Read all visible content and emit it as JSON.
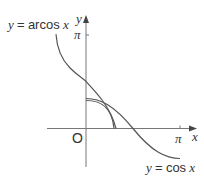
{
  "diagram": {
    "type": "function-graph",
    "axes": {
      "x_label": "x",
      "y_label": "y",
      "origin_label": "O",
      "x_tick_label": "π",
      "y_tick_label": "π"
    },
    "curves": [
      {
        "name": "arccos",
        "label_var": "y",
        "label_eq": "=",
        "label_fn": "arcos",
        "label_arg": "x",
        "color": "#555555"
      },
      {
        "name": "cos",
        "label_var": "y",
        "label_eq": "=",
        "label_fn": "cos",
        "label_arg": "x",
        "color": "#555555"
      },
      {
        "name": "quarter-arc",
        "color": "#555555"
      }
    ],
    "colors": {
      "axis": "#666666",
      "text": "#333333"
    }
  }
}
